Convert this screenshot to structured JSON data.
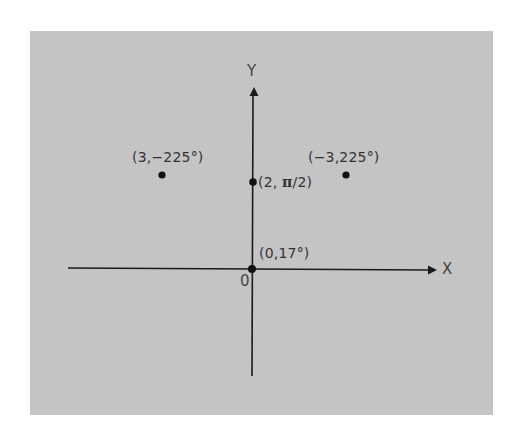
{
  "figure": {
    "background_color": "#c4c4c4",
    "axis_color": "#1a1a1a",
    "point_color": "#111111",
    "axes": {
      "x_label": "X",
      "y_label": "Y",
      "origin_label": "0"
    },
    "points": [
      {
        "id": "p1",
        "label": "(3,−225°)",
        "r": "3",
        "theta": "−225°"
      },
      {
        "id": "p2",
        "label_prefix": "(2, ",
        "label_pi": "π",
        "label_suffix": "/2)",
        "r": "2",
        "theta": "π/2"
      },
      {
        "id": "p3",
        "label": "(−3,225°)",
        "r": "−3",
        "theta": "225°"
      },
      {
        "id": "p4",
        "label": "(0,17°)",
        "r": "0",
        "theta": "17°"
      }
    ]
  }
}
